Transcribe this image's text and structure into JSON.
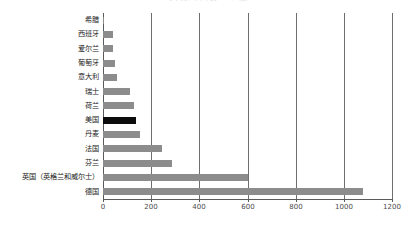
{
  "chart_data": {
    "type": "bar",
    "orientation": "horizontal",
    "title": "每十万人口中的……人数",
    "xlabel": "",
    "ylabel": "",
    "xlim": [
      0,
      1200
    ],
    "xticks": [
      0,
      200,
      400,
      600,
      800,
      1000,
      1200
    ],
    "xtick_labels": [
      "0",
      "200",
      "400",
      "600",
      "800",
      "1000",
      "1200"
    ],
    "grid": true,
    "grid_axis": "x",
    "legend": false,
    "categories": [
      "希腊",
      "西班牙",
      "爱尔兰",
      "葡萄牙",
      "意大利",
      "瑞士",
      "荷兰",
      "美国",
      "丹麦",
      "法国",
      "芬兰",
      "英国（英格兰和威尔士）",
      "德国"
    ],
    "values": [
      5,
      42,
      42,
      50,
      58,
      112,
      128,
      137,
      155,
      245,
      285,
      600,
      1080
    ],
    "bar_color": "#8c8c8c",
    "highlight_color": "#0d0d0d",
    "highlight_category": "美国",
    "highlight_index": 7,
    "axis_color": "#5a5a5a",
    "background": "#ffffff"
  }
}
